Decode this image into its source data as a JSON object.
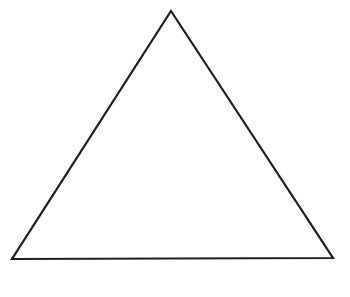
{
  "figure": {
    "shape": "triangle",
    "stroke_color": "#1e1e1e",
    "fill_color": "#ffffff",
    "stroke_width": 2.2,
    "vertices": {
      "apex": {
        "x": 171,
        "y": 11
      },
      "bottom_left": {
        "x": 12,
        "y": 259
      },
      "bottom_right": {
        "x": 333,
        "y": 258
      }
    }
  }
}
